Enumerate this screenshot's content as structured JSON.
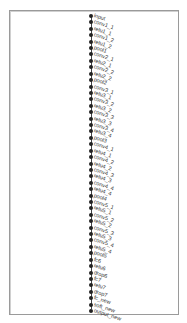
{
  "graph": {
    "title": "",
    "node_color": "#222222",
    "border_color": "#9a9a9a",
    "nodes": [
      "input",
      "conv1_1",
      "relu1_1",
      "conv1_2",
      "relu1_2",
      "pool1",
      "conv2_1",
      "relu2_1",
      "conv2_2",
      "relu2_2",
      "pool2",
      "conv3_1",
      "relu3_1",
      "conv3_2",
      "relu3_2",
      "conv3_3",
      "relu3_3",
      "conv3_4",
      "relu3_4",
      "pool3",
      "conv4_1",
      "relu4_1",
      "conv4_2",
      "relu4_2",
      "conv4_3",
      "relu4_3",
      "conv4_4",
      "relu4_4",
      "pool4",
      "conv5_1",
      "relu5_1",
      "conv5_2",
      "relu5_2",
      "conv5_3",
      "relu5_3",
      "conv5_4",
      "relu5_4",
      "pool5",
      "fc6",
      "relu6",
      "drop6",
      "fc7",
      "relu7",
      "drop7",
      "fc_new",
      "soft_new",
      "output_new"
    ]
  }
}
